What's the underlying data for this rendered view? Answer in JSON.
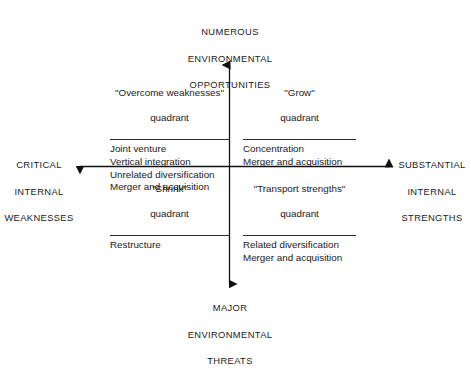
{
  "diagram": {
    "axes": {
      "vertical_top": {
        "line1": "NUMEROUS",
        "line2": "ENVIRONMENTAL",
        "line3": "OPPORTUNITIES"
      },
      "vertical_bottom": {
        "line1": "MAJOR",
        "line2": "ENVIRONMENTAL",
        "line3": "THREATS"
      },
      "horizontal_left": {
        "line1": "CRITICAL",
        "line2": "INTERNAL",
        "line3": "WEAKNESSES"
      },
      "horizontal_right": {
        "line1": "SUBSTANTIAL",
        "line2": "INTERNAL",
        "line3": "STRENGTHS"
      }
    },
    "quadrants": [
      {
        "id": "overcome-weaknesses",
        "position": "top-left",
        "title_line1": "\"Overcome weaknesses\"",
        "title_line2": "quadrant",
        "items": [
          "Joint venture",
          "Vertical integration",
          "Unrelated diversification",
          "Merger and acquisition"
        ]
      },
      {
        "id": "grow",
        "position": "top-right",
        "title_line1": "\"Grow\"",
        "title_line2": "quadrant",
        "items": [
          "Concentration",
          "Merger and acquisition"
        ]
      },
      {
        "id": "shrink",
        "position": "bottom-left",
        "title_line1": "\"Shrink\"",
        "title_line2": "quadrant",
        "items": [
          "Restructure"
        ]
      },
      {
        "id": "transport-strengths",
        "position": "bottom-right",
        "title_line1": "\"Transport strengths\"",
        "title_line2": "quadrant",
        "items": [
          "Related diversification",
          "Merger and acquisition"
        ]
      }
    ],
    "colors": {
      "background": "#ffffff",
      "text": "#1a1a1a",
      "axis": "#111111",
      "rule": "#2a2a2a"
    }
  }
}
